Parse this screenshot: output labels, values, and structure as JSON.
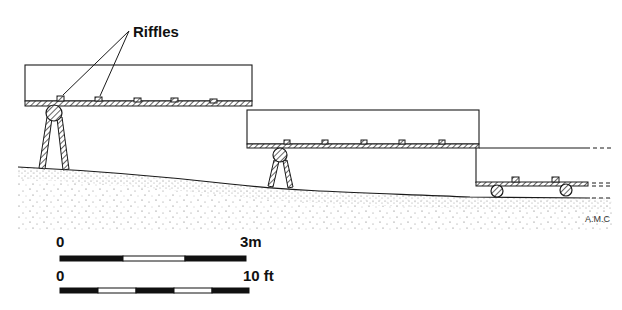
{
  "diagram": {
    "type": "cross-section illustration",
    "callout": {
      "label": "Riffles",
      "points_to": [
        "riffle-1",
        "riffle-2"
      ]
    },
    "sluice_boxes": [
      {
        "id": "box-upper",
        "supports": "trestle",
        "riffle_count": 5
      },
      {
        "id": "box-middle",
        "supports": "trestle",
        "riffle_count": 5
      },
      {
        "id": "box-lower",
        "supports": "rollers",
        "riffle_count": 2,
        "continues_right": true
      }
    ],
    "signature": "A.M.C"
  },
  "scale_bars": [
    {
      "start_label": "0",
      "end_label": "3m",
      "segments": [
        "black",
        "white",
        "black"
      ]
    },
    {
      "start_label": "0",
      "end_label": "10 ft",
      "segments": [
        "black",
        "white",
        "black",
        "white",
        "black"
      ]
    }
  ],
  "colors": {
    "ink": "#1a1a1a",
    "paper": "#ffffff",
    "stipple": "#555555"
  }
}
